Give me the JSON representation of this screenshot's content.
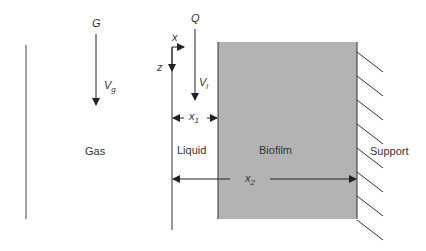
{
  "regions": {
    "gas": "Gas",
    "liquid": "Liquid",
    "biofilm": "Biofilm",
    "support": "Support"
  },
  "variables": {
    "gas_flow": "G",
    "gas_velocity": "V",
    "gas_velocity_sub": "g",
    "liquid_flow": "Q",
    "liquid_velocity": "V",
    "liquid_velocity_sub": "l",
    "axis_x": "x",
    "axis_z": "z",
    "x1": "x",
    "x1_sub": "1",
    "x2": "x",
    "x2_sub": "2"
  },
  "colors": {
    "biofilm_fill": "#b3b3b3",
    "line": "#333333"
  }
}
